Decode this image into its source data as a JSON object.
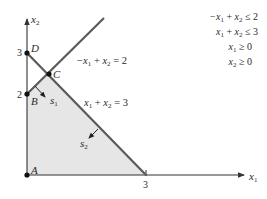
{
  "diagram": {
    "type": "linear-programming-feasible-region",
    "axes": {
      "x_label": "x1",
      "y_label": "x2",
      "x_ticks": [
        "3"
      ],
      "y_ticks": [
        "2",
        "3"
      ]
    },
    "points": [
      {
        "name": "A",
        "coords": [
          0,
          0
        ]
      },
      {
        "name": "B",
        "coords": [
          0,
          2
        ]
      },
      {
        "name": "C",
        "coords": [
          0.5,
          2.5
        ]
      },
      {
        "name": "D",
        "coords": [
          0,
          3
        ]
      }
    ],
    "lines": [
      {
        "label": "−x1 + x2 = 2",
        "label_parts": {
          "lhs_a": "−x",
          "sub_a": "1",
          "op": " + ",
          "lhs_b": "x",
          "sub_b": "2",
          "eq": " = 2"
        }
      },
      {
        "label": "x1 + x2 = 3",
        "label_parts": {
          "lhs_a": "x",
          "sub_a": "1",
          "op": " + ",
          "lhs_b": "x",
          "sub_b": "2",
          "eq": " = 3"
        }
      }
    ],
    "slack_arrows": [
      {
        "label": "s1",
        "name": "s",
        "sub": "1"
      },
      {
        "label": "s2",
        "name": "s",
        "sub": "2"
      }
    ],
    "constraints": [
      {
        "text": "−x1 + x2 ≤ 2",
        "a": "−x",
        "a_sub": "1",
        "mid": " + ",
        "b": "x",
        "b_sub": "2",
        "rel": " ≤ 2"
      },
      {
        "text": "x1 + x2 ≤ 3",
        "a": "x",
        "a_sub": "1",
        "mid": " + ",
        "b": "x",
        "b_sub": "2",
        "rel": " ≤ 3"
      },
      {
        "text": "x1 ≥ 0",
        "a": "x",
        "a_sub": "1",
        "rel": " ≥ 0"
      },
      {
        "text": "x2 ≥ 0",
        "a": "x",
        "a_sub": "2",
        "rel": " ≥ 0"
      }
    ],
    "colors": {
      "region_fill": "#e6e6e6",
      "line": "#555555",
      "axis": "#333333",
      "text": "#2a2a2a"
    }
  }
}
